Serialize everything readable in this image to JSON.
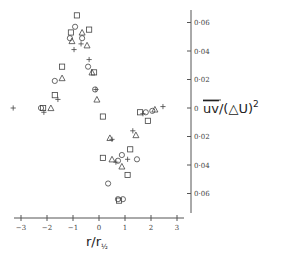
{
  "chart_data": {
    "type": "scatter",
    "title": "",
    "xlabel": "r/r½",
    "ylabel": "uv/(ΔU)²",
    "ylabel_overline": "uv",
    "ylabel_rest": "/(△U)",
    "ylabel_sup": "2",
    "xlabel_main": "r/r",
    "xlabel_sub": "½",
    "xlim": [
      -3.4,
      3.2
    ],
    "ylim": [
      -0.07,
      0.07
    ],
    "xticks": [
      -3,
      -2,
      -1,
      0,
      1,
      2,
      3
    ],
    "xtick_labels": [
      "−3",
      "−2",
      "−1",
      "0",
      "1",
      "2",
      "3"
    ],
    "yticks": [
      0.06,
      0.04,
      0.02,
      0,
      -0.02,
      -0.04,
      -0.06
    ],
    "ytick_labels": [
      "0·06",
      "0·04",
      "0·02",
      "0",
      "0·02",
      "0·04",
      "0·06"
    ],
    "grid": false,
    "legend": null,
    "y_axis_position": "right",
    "series": [
      {
        "name": "squares",
        "marker": "square",
        "points": [
          [
            -0.85,
            0.065
          ],
          [
            -0.38,
            0.055
          ],
          [
            -1.08,
            0.053
          ],
          [
            -1.42,
            0.029
          ],
          [
            -1.7,
            0.009
          ],
          [
            -2.15,
            0.0
          ],
          [
            -0.19,
            0.025
          ],
          [
            0.15,
            -0.006
          ],
          [
            0.15,
            -0.035
          ],
          [
            1.1,
            -0.047
          ],
          [
            0.77,
            -0.065
          ],
          [
            1.2,
            -0.029
          ],
          [
            1.58,
            -0.003
          ],
          [
            1.88,
            -0.009
          ]
        ]
      },
      {
        "name": "circles",
        "marker": "circle",
        "points": [
          [
            -0.92,
            0.057
          ],
          [
            -1.12,
            0.049
          ],
          [
            -0.65,
            0.049
          ],
          [
            -1.7,
            0.019
          ],
          [
            -2.23,
            0.0
          ],
          [
            -0.42,
            0.029
          ],
          [
            -0.15,
            0.013
          ],
          [
            0.35,
            -0.053
          ],
          [
            0.73,
            -0.064
          ],
          [
            0.92,
            -0.064
          ],
          [
            0.73,
            -0.037
          ],
          [
            0.88,
            -0.033
          ],
          [
            1.46,
            -0.036
          ],
          [
            1.8,
            -0.003
          ],
          [
            2.05,
            -0.002
          ]
        ]
      },
      {
        "name": "triangles",
        "marker": "triangle",
        "points": [
          [
            -0.65,
            0.053
          ],
          [
            -1.04,
            0.047
          ],
          [
            -0.46,
            0.044
          ],
          [
            -1.42,
            0.021
          ],
          [
            -1.85,
            0.0
          ],
          [
            -0.27,
            0.025
          ],
          [
            -0.08,
            0.006
          ],
          [
            0.42,
            -0.021
          ],
          [
            0.5,
            -0.036
          ],
          [
            0.88,
            -0.041
          ],
          [
            1.42,
            -0.019
          ],
          [
            2.15,
            -0.001
          ]
        ]
      },
      {
        "name": "crosses",
        "marker": "plus",
        "points": [
          [
            -3.3,
            0.0
          ],
          [
            -2.12,
            -0.003
          ],
          [
            -1.58,
            0.006
          ],
          [
            -0.96,
            0.041
          ],
          [
            -0.69,
            0.045
          ],
          [
            -0.38,
            0.034
          ],
          [
            -0.12,
            0.013
          ],
          [
            0.5,
            -0.022
          ],
          [
            0.65,
            -0.038
          ],
          [
            1.1,
            -0.036
          ],
          [
            1.3,
            -0.016
          ],
          [
            1.69,
            -0.004
          ],
          [
            2.46,
            0.001
          ]
        ]
      }
    ]
  },
  "layout": {
    "x0_px": 99,
    "px_per_x": 26,
    "y0_px": 108,
    "px_per_y": 1425,
    "xaxis_y_px": 218,
    "xaxis_x_from": 14,
    "xaxis_x_to": 184,
    "yaxis_x_px": 191,
    "yaxis_y_from": 10,
    "yaxis_y_to": 213
  }
}
